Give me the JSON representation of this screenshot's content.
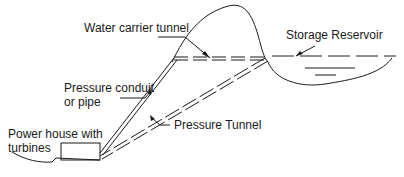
{
  "diagram": {
    "labels": {
      "water_carrier_tunnel": "Water carrier tunnel",
      "storage_reservoir": "Storage Reservoir",
      "pressure_conduit_line1": "Pressure conduit",
      "pressure_conduit_line2": "or pipe",
      "power_house_line1": "Power house with",
      "power_house_line2": "turbines",
      "pressure_tunnel": "Pressure Tunnel"
    },
    "colors": {
      "line": "#1a1a1a",
      "background": "#ffffff"
    }
  }
}
